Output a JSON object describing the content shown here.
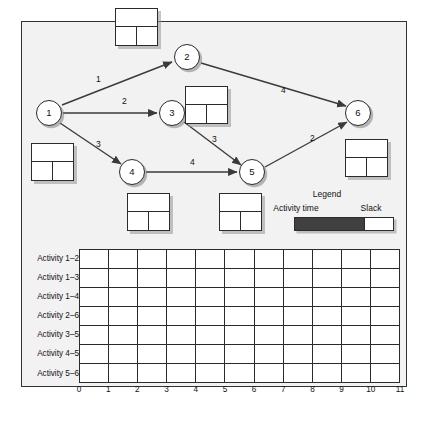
{
  "diagram": {
    "title": "",
    "background_color": "#f2f2f2",
    "nodes": [
      {
        "id": "1",
        "label": "1",
        "x": 49,
        "y": 113
      },
      {
        "id": "2",
        "label": "2",
        "x": 187,
        "y": 57
      },
      {
        "id": "3",
        "label": "3",
        "x": 172,
        "y": 113
      },
      {
        "id": "4",
        "label": "4",
        "x": 132,
        "y": 172
      },
      {
        "id": "5",
        "label": "5",
        "x": 252,
        "y": 172
      },
      {
        "id": "6",
        "label": "6",
        "x": 358,
        "y": 113
      }
    ],
    "edges": [
      {
        "from": "1",
        "to": "2",
        "duration": "1",
        "lx": 96,
        "ly": 80
      },
      {
        "from": "1",
        "to": "3",
        "duration": "2",
        "lx": 122,
        "ly": 102
      },
      {
        "from": "1",
        "to": "4",
        "duration": "3",
        "lx": 96,
        "ly": 145
      },
      {
        "from": "2",
        "to": "6",
        "duration": "4",
        "lx": 281,
        "ly": 91
      },
      {
        "from": "3",
        "to": "5",
        "duration": "3",
        "lx": 212,
        "ly": 140
      },
      {
        "from": "4",
        "to": "5",
        "duration": "4",
        "lx": 190,
        "ly": 163
      },
      {
        "from": "5",
        "to": "6",
        "duration": "2",
        "lx": 310,
        "ly": 139
      }
    ],
    "activity_boxes": [
      {
        "name": "box-node-2",
        "x": 115,
        "y": 8
      },
      {
        "name": "box-node-3",
        "x": 185,
        "y": 86
      },
      {
        "name": "box-node-1",
        "x": 31,
        "y": 143
      },
      {
        "name": "box-node-4",
        "x": 127,
        "y": 193
      },
      {
        "name": "box-node-5",
        "x": 219,
        "y": 193
      },
      {
        "name": "box-node-6",
        "x": 345,
        "y": 139
      }
    ],
    "legend": {
      "title": "Legend",
      "activity_time_label": "Activity time",
      "slack_label": "Slack",
      "activity_time_color": "#404040",
      "slack_color": "#ffffff",
      "activity_time_x": 296,
      "activity_time_y": 204,
      "slack_x": 359,
      "slack_y": 204,
      "title_x": 327,
      "title_y": 192
    }
  },
  "chart_data": {
    "type": "table",
    "title": "",
    "xlabel": "",
    "ylabel": "",
    "categories": [
      "Activity 1–2",
      "Activity 1–3",
      "Activity 1–4",
      "Activity 2–6",
      "Activity 3–5",
      "Activity 4–5",
      "Activity 5–6"
    ],
    "x_tick_labels": [
      "0",
      "1",
      "2",
      "3",
      "4",
      "5",
      "6",
      "7",
      "8",
      "9",
      "10",
      "11"
    ],
    "xlim": [
      0,
      11
    ],
    "columns": 11,
    "rows": 7,
    "grid": true,
    "values": [
      [
        null,
        null,
        null,
        null,
        null,
        null,
        null,
        null,
        null,
        null,
        null
      ],
      [
        null,
        null,
        null,
        null,
        null,
        null,
        null,
        null,
        null,
        null,
        null
      ],
      [
        null,
        null,
        null,
        null,
        null,
        null,
        null,
        null,
        null,
        null,
        null
      ],
      [
        null,
        null,
        null,
        null,
        null,
        null,
        null,
        null,
        null,
        null,
        null
      ],
      [
        null,
        null,
        null,
        null,
        null,
        null,
        null,
        null,
        null,
        null,
        null
      ],
      [
        null,
        null,
        null,
        null,
        null,
        null,
        null,
        null,
        null,
        null,
        null
      ],
      [
        null,
        null,
        null,
        null,
        null,
        null,
        null,
        null,
        null,
        null,
        null
      ]
    ],
    "legend_position": "above-right"
  }
}
